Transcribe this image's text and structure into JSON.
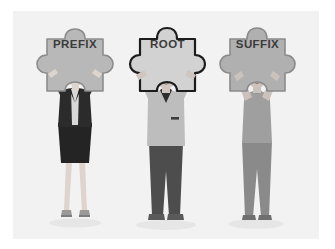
{
  "illustration": {
    "title": "Prefix Root Suffix word parts illustration",
    "background_color": "#ffffff",
    "panel_color": "#f2f2f2",
    "ground_shadow_color": "#e4e4e4"
  },
  "pieces": [
    {
      "id": "prefix",
      "label": "PREFIX",
      "fill": "#b8b8b8",
      "stroke": "#8c8c8c",
      "text_color": "#3b3b3b"
    },
    {
      "id": "root",
      "label": "ROOT",
      "fill": "#d2d2d2",
      "stroke": "#1c1c1c",
      "text_color": "#2a2a2a"
    },
    {
      "id": "suffix",
      "label": "SUFFIX",
      "fill": "#b0b0b0",
      "stroke": "#8a8a8a",
      "text_color": "#3b3b3b"
    }
  ],
  "figures": [
    {
      "id": "woman-suit",
      "description": "Woman in dark business suit holding the PREFIX puzzle piece",
      "hair_color": "#2e2e2e",
      "skin_color": "#dcd3cd",
      "top_color": "#2b2b2b",
      "bottom_color": "#242424",
      "shoe_color": "#8f8f8f"
    },
    {
      "id": "man-shirt",
      "description": "Man with glasses in light shirt holding the ROOT puzzle piece",
      "hair_color": "#3a3a3a",
      "skin_color": "#cfc6bf",
      "top_color": "#bdbdbd",
      "bottom_color": "#4d4d4d",
      "shoe_color": "#5a5a5a"
    },
    {
      "id": "woman-ponytail",
      "description": "Woman with ponytail in tee and leggings holding the SUFFIX puzzle piece",
      "hair_color": "#1f1f1f",
      "skin_color": "#cbc2bb",
      "top_color": "#9f9f9f",
      "bottom_color": "#8a8a8a",
      "shoe_color": "#6f6f6f"
    }
  ]
}
